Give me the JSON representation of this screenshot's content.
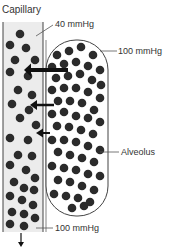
{
  "title": "Capillary",
  "labels": {
    "capillary_top_pressure": "40 mmHg",
    "alveolus_pressure": "100 mmHg",
    "alveolus": "Alveolus",
    "capillary_bottom_pressure": "100 mmHg"
  },
  "colors": {
    "molecule": "#2b2b2b",
    "outline": "#444444",
    "capillary_fill": "#ececec",
    "alveolus_fill": "#ffffff",
    "arrow": "#111111"
  },
  "capillary_molecules": [
    [
      20,
      34
    ],
    [
      10,
      45
    ],
    [
      26,
      48
    ],
    [
      15,
      60
    ],
    [
      35,
      60
    ],
    [
      10,
      72
    ],
    [
      28,
      76
    ],
    [
      18,
      90
    ],
    [
      32,
      95
    ],
    [
      12,
      104
    ],
    [
      29,
      110
    ],
    [
      36,
      125
    ],
    [
      20,
      118
    ],
    [
      10,
      138
    ],
    [
      28,
      140
    ],
    [
      18,
      155
    ],
    [
      32,
      156
    ],
    [
      10,
      165
    ],
    [
      26,
      170
    ],
    [
      35,
      178
    ],
    [
      14,
      182
    ],
    [
      24,
      188
    ],
    [
      34,
      190
    ],
    [
      10,
      196
    ],
    [
      22,
      200
    ],
    [
      33,
      205
    ],
    [
      12,
      212
    ],
    [
      24,
      214
    ],
    [
      35,
      218
    ],
    [
      10,
      224
    ],
    [
      24,
      226
    ]
  ],
  "alveolus_molecules": [
    [
      57,
      55
    ],
    [
      69,
      51
    ],
    [
      81,
      47
    ],
    [
      93,
      55
    ],
    [
      52,
      67
    ],
    [
      64,
      64
    ],
    [
      76,
      62
    ],
    [
      88,
      66
    ],
    [
      100,
      70
    ],
    [
      56,
      78
    ],
    [
      68,
      76
    ],
    [
      80,
      74
    ],
    [
      92,
      80
    ],
    [
      101,
      85
    ],
    [
      52,
      90
    ],
    [
      64,
      88
    ],
    [
      76,
      88
    ],
    [
      88,
      92
    ],
    [
      100,
      98
    ],
    [
      58,
      101
    ],
    [
      70,
      101
    ],
    [
      82,
      103
    ],
    [
      94,
      110
    ],
    [
      52,
      114
    ],
    [
      64,
      112
    ],
    [
      76,
      116
    ],
    [
      88,
      118
    ],
    [
      100,
      122
    ],
    [
      57,
      126
    ],
    [
      69,
      127
    ],
    [
      81,
      130
    ],
    [
      93,
      134
    ],
    [
      52,
      140
    ],
    [
      64,
      140
    ],
    [
      76,
      142
    ],
    [
      88,
      146
    ],
    [
      100,
      150
    ],
    [
      58,
      152
    ],
    [
      70,
      155
    ],
    [
      82,
      158
    ],
    [
      94,
      162
    ],
    [
      52,
      166
    ],
    [
      64,
      168
    ],
    [
      76,
      170
    ],
    [
      88,
      174
    ],
    [
      100,
      176
    ],
    [
      58,
      180
    ],
    [
      70,
      182
    ],
    [
      82,
      186
    ],
    [
      94,
      190
    ],
    [
      54,
      194
    ],
    [
      66,
      196
    ],
    [
      78,
      198
    ],
    [
      90,
      202
    ],
    [
      72,
      208
    ],
    [
      84,
      206
    ]
  ],
  "arrows": [
    {
      "x1": 68,
      "x2": 24,
      "y": 70,
      "width": 4
    },
    {
      "x1": 54,
      "x2": 30,
      "y": 105,
      "width": 2.5
    },
    {
      "x1": 50,
      "x2": 36,
      "y": 133,
      "width": 2
    }
  ]
}
